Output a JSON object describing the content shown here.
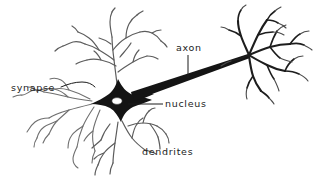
{
  "diagram": {
    "background_color": "#ffffff",
    "ink_color": "#1b1b1b",
    "dendrite_color": "#6e6e6e",
    "width": 332,
    "height": 180,
    "labels": [
      {
        "id": "synapse",
        "text": "synapse",
        "x": 11,
        "y": 83,
        "leader": "wavy-line-to-left-dendrite-tip"
      },
      {
        "id": "axon",
        "text": "axon",
        "x": 176,
        "y": 43,
        "leader": "vertical-line-down-to-axon-shaft"
      },
      {
        "id": "nucleus",
        "text": "nucleus",
        "x": 165,
        "y": 99,
        "leader": "horizontal-line-left-to-nucleus"
      },
      {
        "id": "dendrites",
        "text": "dendrites",
        "x": 142,
        "y": 147,
        "leader": "none"
      }
    ],
    "parts": [
      {
        "id": "soma",
        "label": "cell body (soma)",
        "shape": "black stellate star",
        "cx": 118,
        "cy": 103
      },
      {
        "id": "nucleus",
        "label": "nucleus",
        "shape": "white oval",
        "cx": 117,
        "cy": 101
      },
      {
        "id": "axon",
        "label": "axon",
        "shape": "tapering black wedge",
        "from_x": 135,
        "from_y": 98,
        "to_x": 248,
        "to_y": 56
      },
      {
        "id": "axon-terminals",
        "label": "axon terminal arbor",
        "shape": "branching arbor",
        "hub_x": 249,
        "hub_y": 55
      },
      {
        "id": "dendrites-top",
        "label": "apical dendrites",
        "shape": "branching arbor",
        "hub_x": 117,
        "hub_y": 82
      },
      {
        "id": "dendrites-left",
        "label": "left dendrites",
        "shape": "branching arbor",
        "hub_x": 92,
        "hub_y": 103
      },
      {
        "id": "dendrites-bottom",
        "label": "basal dendrites",
        "shape": "branching arbor",
        "hub_x": 120,
        "hub_y": 122
      }
    ]
  }
}
